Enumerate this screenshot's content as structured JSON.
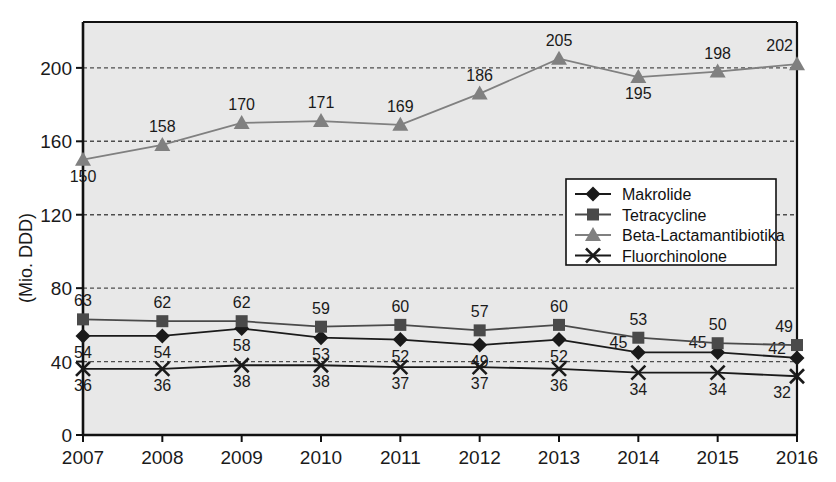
{
  "chart_data": {
    "type": "line",
    "title": "",
    "xlabel": "",
    "ylabel": "(Mio. DDD)",
    "categories": [
      "2007",
      "2008",
      "2009",
      "2010",
      "2011",
      "2012",
      "2013",
      "2014",
      "2015",
      "2016"
    ],
    "ylim": [
      0,
      225
    ],
    "yticks": [
      0,
      40,
      80,
      120,
      160,
      200
    ],
    "ytick_labels": [
      "0",
      "40",
      "80",
      "120",
      "160",
      "200"
    ],
    "grid": true,
    "legend_position": "center-right",
    "series": [
      {
        "name": "Makrolide",
        "marker": "diamond",
        "color": "#1a1a1a",
        "values": [
          54,
          54,
          58,
          53,
          52,
          49,
          52,
          45,
          45,
          42
        ],
        "label_positions": [
          "below",
          "below",
          "below",
          "below",
          "below",
          "below",
          "below",
          "right",
          "right",
          "right"
        ]
      },
      {
        "name": "Tetracycline",
        "marker": "square",
        "color": "#4a4a4a",
        "values": [
          63,
          62,
          62,
          59,
          60,
          57,
          60,
          53,
          50,
          49
        ],
        "label_positions": [
          "above",
          "above",
          "above",
          "above",
          "above",
          "above",
          "above",
          "above",
          "above",
          "above"
        ]
      },
      {
        "name": "Beta-Lactamantibiotika",
        "marker": "triangle",
        "color": "#808080",
        "values": [
          150,
          158,
          170,
          171,
          169,
          186,
          205,
          195,
          198,
          202
        ],
        "label_positions": [
          "below",
          "above",
          "above",
          "above",
          "above",
          "above",
          "above",
          "below",
          "above",
          "above"
        ]
      },
      {
        "name": "Fluorchinolone",
        "marker": "cross",
        "color": "#1a1a1a",
        "values": [
          36,
          36,
          38,
          38,
          37,
          37,
          36,
          34,
          34,
          32
        ],
        "label_positions": [
          "below",
          "below",
          "below",
          "below",
          "below",
          "below",
          "below",
          "below",
          "below",
          "below"
        ]
      }
    ]
  },
  "axis": {
    "y_title": "(Mio. DDD)",
    "y_tick_0": "0",
    "y_tick_40": "40",
    "y_tick_80": "80",
    "y_tick_120": "120",
    "y_tick_160": "160",
    "y_tick_200": "200"
  },
  "legend": {
    "items": [
      {
        "label": "Makrolide",
        "marker": "diamond-marker-icon",
        "color": "#1a1a1a"
      },
      {
        "label": "Tetracycline",
        "marker": "square-marker-icon",
        "color": "#4a4a4a"
      },
      {
        "label": "Beta-Lactamantibiotika",
        "marker": "triangle-marker-icon",
        "color": "#808080"
      },
      {
        "label": "Fluorchinolone",
        "marker": "cross-marker-icon",
        "color": "#1a1a1a"
      }
    ]
  },
  "colors": {
    "plot_background": "#e8e8e8",
    "axis": "#111111",
    "grid": "#4d4d4d",
    "page_background": "#ffffff"
  }
}
